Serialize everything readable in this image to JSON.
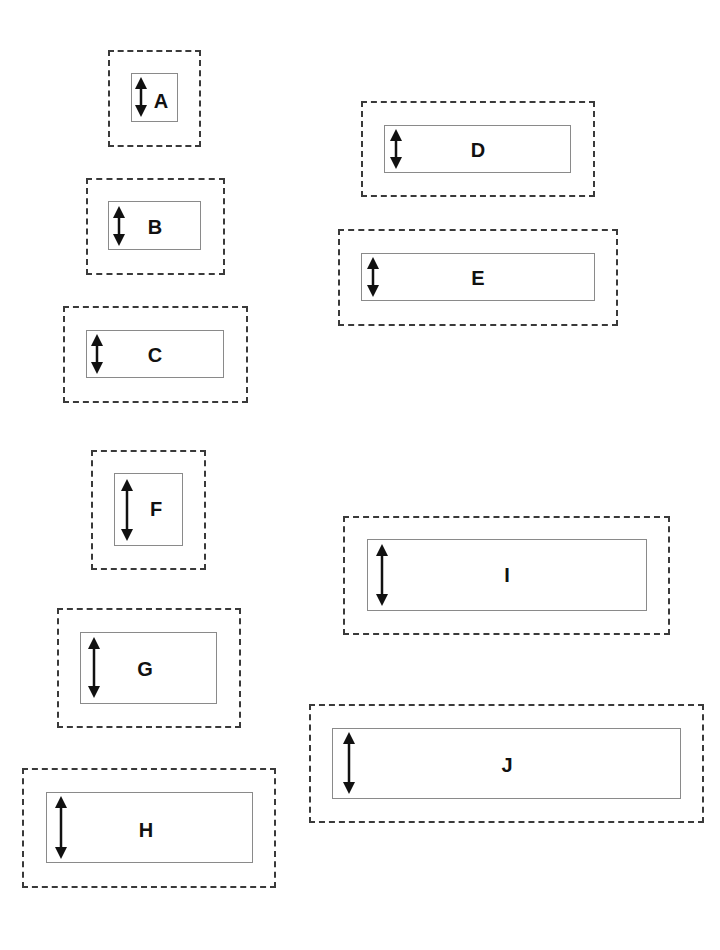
{
  "diagram": {
    "boxes": [
      {
        "label": "A",
        "outer": [
          108,
          50,
          93,
          97
        ],
        "inner": [
          131,
          73,
          47,
          49
        ],
        "arrow": [
          141,
          77,
          117
        ],
        "text_pos": [
          161,
          101
        ]
      },
      {
        "label": "B",
        "outer": [
          86,
          178,
          139,
          97
        ],
        "inner": [
          108,
          201,
          93,
          49
        ],
        "arrow": [
          119,
          206,
          246
        ],
        "text_pos": [
          155,
          227
        ]
      },
      {
        "label": "C",
        "outer": [
          63,
          306,
          185,
          97
        ],
        "inner": [
          86,
          330,
          138,
          48
        ],
        "arrow": [
          97,
          334,
          374
        ],
        "text_pos": [
          155,
          355
        ]
      },
      {
        "label": "D",
        "outer": [
          361,
          101,
          234,
          96
        ],
        "inner": [
          384,
          125,
          187,
          48
        ],
        "arrow": [
          396,
          129,
          169
        ],
        "text_pos": [
          478,
          150
        ]
      },
      {
        "label": "E",
        "outer": [
          338,
          229,
          280,
          97
        ],
        "inner": [
          361,
          253,
          234,
          48
        ],
        "arrow": [
          373,
          257,
          297
        ],
        "text_pos": [
          478,
          278
        ]
      },
      {
        "label": "F",
        "outer": [
          91,
          450,
          115,
          120
        ],
        "inner": [
          114,
          473,
          69,
          73
        ],
        "arrow": [
          127,
          479,
          541
        ],
        "text_pos": [
          156,
          509
        ]
      },
      {
        "label": "G",
        "outer": [
          57,
          608,
          184,
          120
        ],
        "inner": [
          80,
          632,
          137,
          72
        ],
        "arrow": [
          94,
          637,
          698
        ],
        "text_pos": [
          145,
          669
        ]
      },
      {
        "label": "H",
        "outer": [
          22,
          768,
          254,
          120
        ],
        "inner": [
          46,
          792,
          207,
          71
        ],
        "arrow": [
          61,
          796,
          859
        ],
        "text_pos": [
          146,
          830
        ]
      },
      {
        "label": "I",
        "outer": [
          343,
          516,
          327,
          119
        ],
        "inner": [
          367,
          539,
          280,
          72
        ],
        "arrow": [
          382,
          544,
          606
        ],
        "text_pos": [
          507,
          575
        ]
      },
      {
        "label": "J",
        "outer": [
          309,
          704,
          395,
          119
        ],
        "inner": [
          332,
          728,
          349,
          71
        ],
        "arrow": [
          349,
          732,
          794
        ],
        "text_pos": [
          507,
          765
        ]
      }
    ],
    "arrow_icon": "vertical-double-arrow",
    "colors": {
      "dashed_border": "#3a3a3a",
      "inner_border": "#8a8a8a",
      "arrow": "#111111",
      "text": "#111111",
      "background": "#ffffff"
    }
  }
}
